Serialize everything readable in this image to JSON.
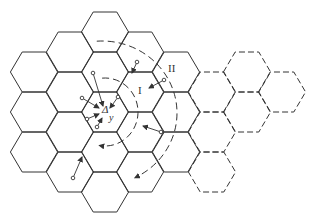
{
  "diagram": {
    "stroke_color": "#333333",
    "hex_size": 23.6,
    "hex_half_height": 20,
    "solid_cells": [
      [
        34,
        72
      ],
      [
        34,
        112
      ],
      [
        34,
        152
      ],
      [
        70,
        52
      ],
      [
        70,
        92
      ],
      [
        70,
        132
      ],
      [
        70,
        172
      ],
      [
        105,
        32
      ],
      [
        105,
        72
      ],
      [
        105,
        112
      ],
      [
        105,
        152
      ],
      [
        105,
        192
      ],
      [
        140,
        52
      ],
      [
        140,
        92
      ],
      [
        140,
        132
      ],
      [
        140,
        172
      ],
      [
        176,
        72
      ],
      [
        176,
        112
      ],
      [
        176,
        152
      ]
    ],
    "dashed_cells": [
      [
        212,
        92
      ],
      [
        212,
        132
      ],
      [
        212,
        172
      ],
      [
        247,
        72
      ],
      [
        247,
        112
      ],
      [
        282,
        92
      ]
    ],
    "center_cell": {
      "x": 105,
      "y": 112
    },
    "labels": {
      "center_symbol": "Δ",
      "center_sub": "y",
      "ring_1": "I",
      "ring_2": "II"
    },
    "arrows": [
      {
        "from": [
          93,
          73
        ],
        "to": [
          103,
          106
        ]
      },
      {
        "from": [
          82,
          98
        ],
        "to": [
          99,
          108
        ]
      },
      {
        "from": [
          87,
          119
        ],
        "to": [
          99,
          114
        ]
      },
      {
        "from": [
          97,
          127
        ],
        "to": [
          102,
          118
        ]
      },
      {
        "from": [
          118,
          97
        ],
        "to": [
          110,
          108
        ]
      },
      {
        "from": [
          137,
          62
        ],
        "to": [
          132,
          73
        ]
      },
      {
        "from": [
          164,
          80
        ],
        "to": [
          149,
          88
        ]
      },
      {
        "from": [
          161,
          132
        ],
        "to": [
          143,
          126
        ]
      },
      {
        "from": [
          73,
          178
        ],
        "to": [
          82,
          157
        ]
      }
    ],
    "arcs": [
      {
        "name": "ring-I",
        "cx": 105,
        "cy": 112,
        "rx": 33,
        "ry": 34,
        "start_deg": -95,
        "end_deg": 100
      },
      {
        "name": "ring-II",
        "cx": 102,
        "cy": 113,
        "rx": 75,
        "ry": 72,
        "start_deg": -94,
        "end_deg": 64
      }
    ]
  }
}
